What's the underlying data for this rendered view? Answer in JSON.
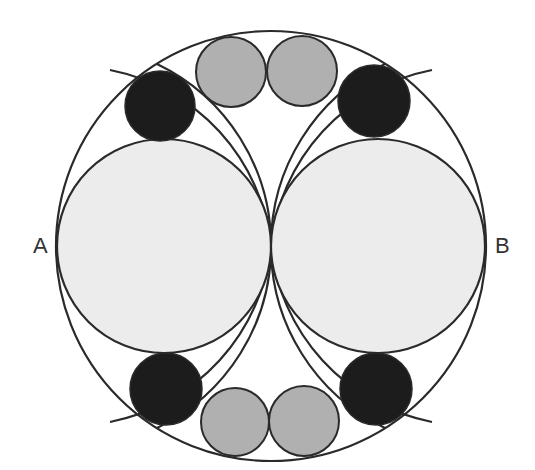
{
  "diagram": {
    "labels": {
      "left": "A",
      "right": "B"
    },
    "colors": {
      "stroke": "#2a2a2a",
      "large_fill": "#ececec",
      "gray_fill": "#b0b0b0",
      "black_fill": "#1c1c1c",
      "background": "#ffffff"
    },
    "outer_circle": {
      "cx": 271,
      "cy": 246,
      "r": 215
    },
    "large_circles": [
      {
        "cx": 164,
        "cy": 246,
        "r": 107
      },
      {
        "cx": 378,
        "cy": 246,
        "r": 107
      }
    ],
    "black_circles": [
      {
        "cx": 160,
        "cy": 106,
        "r": 35
      },
      {
        "cx": 374,
        "cy": 101,
        "r": 36
      },
      {
        "cx": 166,
        "cy": 389,
        "r": 36
      },
      {
        "cx": 376,
        "cy": 389,
        "r": 36
      }
    ],
    "gray_circles": [
      {
        "cx": 231,
        "cy": 72,
        "r": 35
      },
      {
        "cx": 302,
        "cy": 71,
        "r": 35
      },
      {
        "cx": 235,
        "cy": 422,
        "r": 34
      },
      {
        "cx": 304,
        "cy": 421,
        "r": 35
      }
    ]
  }
}
